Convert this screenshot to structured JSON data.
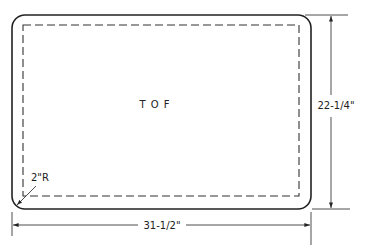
{
  "drawing": {
    "panel_label": "T O F",
    "corner_radius_label": "2\"R",
    "width_dimension": "31-1/2\"",
    "height_dimension": "22-1/4\""
  },
  "colors": {
    "line": "#222222",
    "background": "#ffffff"
  }
}
